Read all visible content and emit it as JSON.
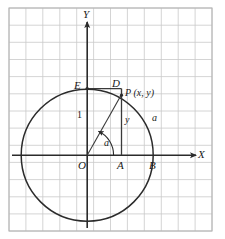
{
  "figure": {
    "kind": "unit-circle-trigonometry-diagram",
    "background": "#ffffff",
    "grid": {
      "visible": true,
      "cell_px": 16.6,
      "line_color": "#c9c9c9",
      "border_color": "#b0b0b0",
      "left": 9,
      "top": 8,
      "right": 212,
      "bottom": 231,
      "cols": 12,
      "rows": 13
    },
    "stroke_color": "#2b2b2b",
    "axes": {
      "x_label": "X",
      "y_label": "Y",
      "origin_label": "O"
    },
    "points": [
      {
        "id": "E",
        "label": "E",
        "x": 87,
        "y": 88
      },
      {
        "id": "D",
        "label": "D",
        "x": 121,
        "y": 88
      },
      {
        "id": "P",
        "label": "P (x, y)",
        "x": 121,
        "y": 95
      },
      {
        "id": "A",
        "label": "A",
        "x": 121,
        "y": 155
      },
      {
        "id": "B",
        "label": "B",
        "x": 153,
        "y": 155
      },
      {
        "id": "O",
        "label": "O",
        "x": 87,
        "y": 155
      }
    ],
    "segment_labels": {
      "unit_vertical": "1",
      "ordinate": "y",
      "radius_outer": "a",
      "angle": "a"
    },
    "circle": {
      "center_x": 87,
      "center_y": 155,
      "radius": 66
    }
  }
}
